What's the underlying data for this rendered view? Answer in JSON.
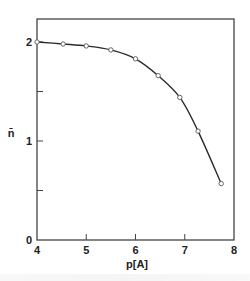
{
  "chart_data": {
    "type": "line",
    "title": "",
    "xlabel": "p[A]",
    "ylabel": "n̄",
    "xlim": [
      4,
      8
    ],
    "ylim": [
      0,
      2.2
    ],
    "xticks": [
      4,
      5,
      6,
      7,
      8
    ],
    "yticks": [
      0,
      0.5,
      1,
      1.5,
      2
    ],
    "ytick_labels": [
      "0",
      "",
      "1",
      "",
      "2"
    ],
    "grid": false,
    "legend": null,
    "series": [
      {
        "name": "n̄ vs p[A]",
        "marker": "open-circle",
        "x": [
          4.0,
          4.53,
          5.0,
          5.5,
          6.0,
          6.46,
          6.9,
          7.27,
          7.74
        ],
        "y": [
          2.0,
          1.98,
          1.96,
          1.92,
          1.83,
          1.66,
          1.44,
          1.1,
          0.57
        ]
      }
    ]
  },
  "axes": {
    "x_label": "p[A]",
    "y_label": "n̄",
    "x_tick_labels": [
      "4",
      "5",
      "6",
      "7",
      "8"
    ],
    "y_tick_labels": [
      "0",
      "1",
      "2"
    ]
  },
  "colors": {
    "line": "#2a2a2a",
    "frame": "#444444",
    "marker_stroke": "#666666"
  }
}
